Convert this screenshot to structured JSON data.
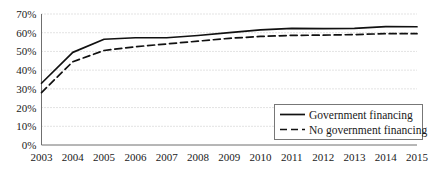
{
  "chart_data": {
    "type": "line",
    "title": "",
    "subtitle": "",
    "xlabel": "",
    "ylabel": "",
    "grid": true,
    "legend_position": "inside-bottom-right",
    "categories": [
      "2003",
      "2004",
      "2005",
      "2006",
      "2007",
      "2008",
      "2009",
      "2010",
      "2011",
      "2012",
      "2013",
      "2014",
      "2015"
    ],
    "x": [
      2003,
      2004,
      2005,
      2006,
      2007,
      2008,
      2009,
      2010,
      2011,
      2012,
      2013,
      2014,
      2015
    ],
    "xlim": [
      2003,
      2015
    ],
    "ylim": [
      0,
      70
    ],
    "y_unit": "%",
    "y_ticks": [
      0,
      10,
      20,
      30,
      40,
      50,
      60,
      70
    ],
    "y_tick_labels": [
      "0%",
      "10%",
      "20%",
      "30%",
      "40%",
      "50%",
      "60%",
      "70%"
    ],
    "series": [
      {
        "name": "Government financing",
        "style": "solid",
        "color": "#111111",
        "values": [
          33,
          49.5,
          56.5,
          57.3,
          57.3,
          58.5,
          60,
          61.5,
          62.3,
          62.2,
          62.3,
          63.3,
          63.2
        ]
      },
      {
        "name": "No government financing",
        "style": "dashed",
        "color": "#111111",
        "values": [
          28,
          44.5,
          50.5,
          52.5,
          54,
          55.5,
          57,
          58,
          58.6,
          58.7,
          59,
          59.5,
          59.5
        ]
      }
    ]
  },
  "legend": {
    "entries": [
      {
        "label": "Government financing",
        "style": "solid"
      },
      {
        "label": "No government financing",
        "style": "dashed"
      }
    ]
  },
  "axes": {
    "y_tick_labels": [
      "70%",
      "60%",
      "50%",
      "40%",
      "30%",
      "20%",
      "10%",
      "0%"
    ],
    "x_tick_labels": [
      "2003",
      "2004",
      "2005",
      "2006",
      "2007",
      "2008",
      "2009",
      "2010",
      "2011",
      "2012",
      "2013",
      "2014",
      "2015"
    ]
  }
}
